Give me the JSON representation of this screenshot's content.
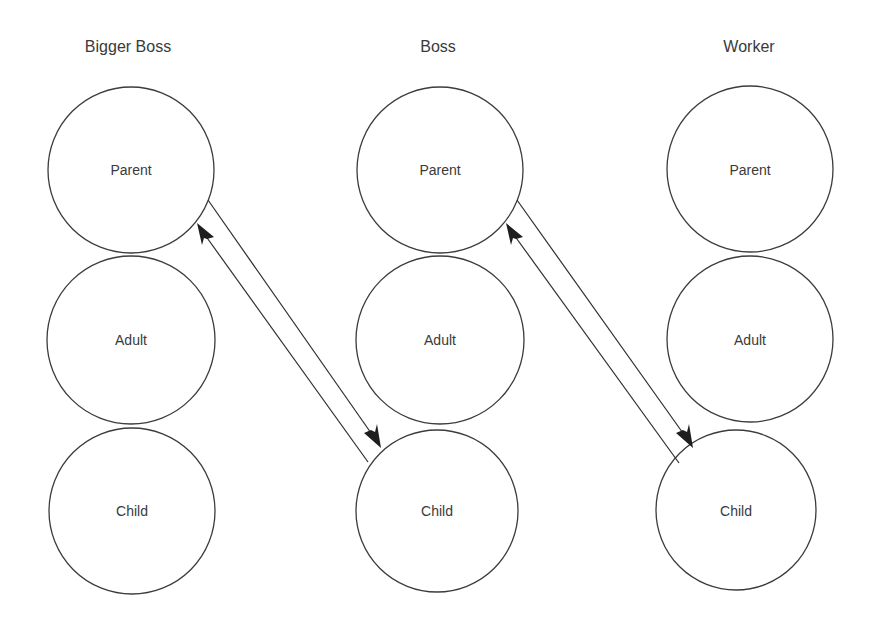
{
  "diagram": {
    "type": "transactional-analysis-ego-states",
    "columns": [
      {
        "title": "Bigger Boss",
        "nodes": [
          {
            "label": "Parent",
            "cx": 131,
            "cy": 170,
            "r": 83
          },
          {
            "label": "Adult",
            "cx": 131,
            "cy": 340,
            "r": 83
          },
          {
            "label": "Child",
            "cx": 131,
            "cy": 511,
            "r": 83
          }
        ]
      },
      {
        "title": "Boss",
        "nodes": [
          {
            "label": "Parent",
            "cx": 440,
            "cy": 170,
            "r": 83
          },
          {
            "label": "Adult",
            "cx": 440,
            "cy": 340,
            "r": 83
          },
          {
            "label": "Child",
            "cx": 437,
            "cy": 511,
            "r": 80
          }
        ]
      },
      {
        "title": "Worker",
        "nodes": [
          {
            "label": "Parent",
            "cx": 750,
            "cy": 170,
            "r": 83
          },
          {
            "label": "Adult",
            "cx": 750,
            "cy": 339,
            "r": 83
          },
          {
            "label": "Child",
            "cx": 736,
            "cy": 510,
            "r": 80
          }
        ]
      }
    ],
    "edges": [
      {
        "from": "Bigger Boss.Parent",
        "to": "Boss.Child",
        "direction": "down"
      },
      {
        "from": "Boss.Child",
        "to": "Bigger Boss.Parent",
        "direction": "up"
      },
      {
        "from": "Boss.Parent",
        "to": "Worker.Child",
        "direction": "down"
      },
      {
        "from": "Worker.Child",
        "to": "Boss.Parent",
        "direction": "up"
      }
    ]
  }
}
